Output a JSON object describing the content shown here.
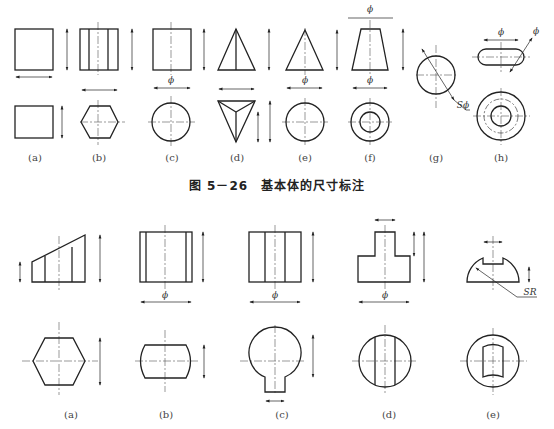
{
  "figure_1": {
    "caption": "图 5－26　基本体的尺寸标注",
    "labels": [
      "(a)",
      "(b)",
      "(c)",
      "(d)",
      "(e)",
      "(f)",
      "(g)",
      "(h)"
    ],
    "annotations": {
      "phi": "ϕ",
      "sphere_phi": "Sϕ"
    }
  },
  "figure_2": {
    "labels": [
      "(a)",
      "(b)",
      "(c)",
      "(d)",
      "(e)"
    ],
    "annotations": {
      "phi": "ϕ",
      "sphere_radius": "SR"
    }
  }
}
